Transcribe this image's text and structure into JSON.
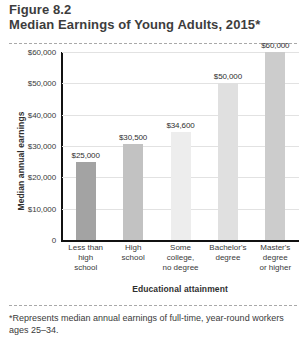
{
  "header": {
    "figure_label": "Figure 8.2",
    "title": "Median Earnings of Young Adults, 2015*"
  },
  "footnote": "*Represents median annual earnings of full-time, year-round workers ages 25–34.",
  "chart_data": {
    "type": "bar",
    "title": "Median Earnings of Young Adults, 2015*",
    "xlabel": "Educational attainment",
    "ylabel": "Median annual earnings",
    "categories": [
      "Less than high school",
      "High school",
      "Some college, no degree",
      "Bachelor's degree",
      "Master's degree or higher"
    ],
    "category_lines": [
      [
        "Less than",
        "high",
        "school"
      ],
      [
        "High",
        "school"
      ],
      [
        "Some",
        "college,",
        "no degree"
      ],
      [
        "Bachelor's",
        "degree"
      ],
      [
        "Master's",
        "degree",
        "or higher"
      ]
    ],
    "values": [
      25000,
      30500,
      34600,
      50000,
      60000
    ],
    "value_labels": [
      "$25,000",
      "$30,500",
      "$34,600",
      "$50,000",
      "$60,000"
    ],
    "bar_colors": [
      "#a3a3a3",
      "#c2c2c2",
      "#ededed",
      "#e0e0e0",
      "#cccccc"
    ],
    "ylim": [
      0,
      60000
    ],
    "yticks": [
      0,
      10000,
      20000,
      30000,
      40000,
      50000,
      60000
    ],
    "ytick_labels": [
      "0",
      "$10,000",
      "$20,000",
      "$30,000",
      "$40,000",
      "$50,000",
      "$60,000"
    ],
    "grid": true,
    "legend": "none"
  }
}
